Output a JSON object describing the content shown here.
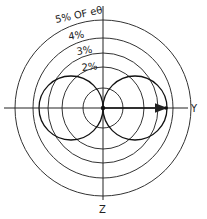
{
  "diagram": {
    "type": "polar_pattern",
    "center": {
      "x": 103,
      "y": 108
    },
    "rings": [
      {
        "r": 20,
        "label": ""
      },
      {
        "r": 41,
        "label": "2%"
      },
      {
        "r": 55,
        "label": "3%"
      },
      {
        "r": 70,
        "label": "4%"
      },
      {
        "r": 88,
        "label": "5% OF eθ"
      }
    ],
    "lobes": [
      {
        "cx": 71,
        "cy": 108,
        "r": 32
      },
      {
        "cx": 135,
        "cy": 108,
        "r": 32
      }
    ],
    "axes": {
      "y_label": "Y",
      "z_label": "Z"
    },
    "arrow": {
      "x1": 103,
      "y1": 108,
      "x2": 168,
      "y2": 108,
      "dot_x": 166
    },
    "colors": {
      "line": "#222222",
      "background": "#ffffff"
    }
  }
}
